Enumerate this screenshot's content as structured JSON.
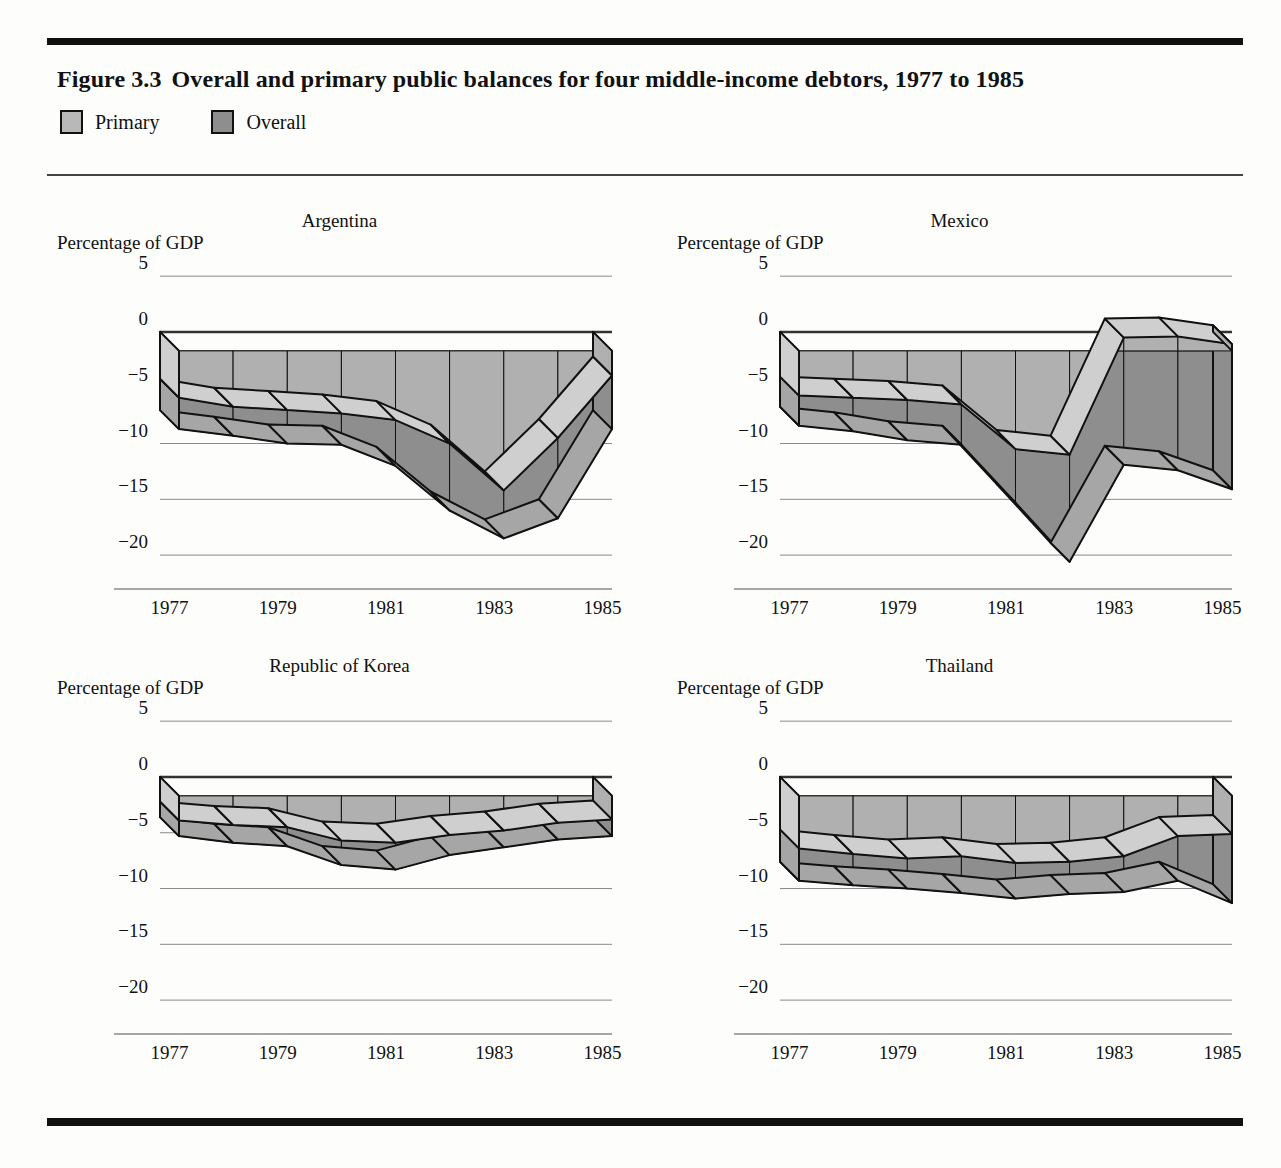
{
  "figure": {
    "number": "Figure 3.3",
    "title": "Overall and primary public balances for four middle-income debtors, 1977 to 1985",
    "unit_label": "Percentage of GDP"
  },
  "legend": {
    "items": [
      {
        "label": "Primary",
        "color": "#b8b8b8"
      },
      {
        "label": "Overall",
        "color": "#8e8e8e"
      }
    ]
  },
  "colors": {
    "primary_top": "#b0b0b0",
    "primary_side": "#cfcfcf",
    "overall_top": "#8e8e8e",
    "overall_side": "#a6a6a6",
    "outline": "#111111",
    "gridline": "#8a8a8a",
    "zeroline": "#333333",
    "rule": "#111111"
  },
  "axis": {
    "yticks": [
      "5",
      "0",
      "-5",
      "-10",
      "-15",
      "-20"
    ],
    "ytick_values": [
      5,
      0,
      -5,
      -10,
      -15,
      -20
    ],
    "ylim": [
      -22.5,
      6
    ],
    "xticks": [
      "1977",
      "1979",
      "1981",
      "1983",
      "1985"
    ],
    "xtick_values": [
      1977,
      1979,
      1981,
      1983,
      1985
    ],
    "years": [
      1977,
      1978,
      1979,
      1980,
      1981,
      1982,
      1983,
      1984,
      1985
    ]
  },
  "chart_data": {
    "type": "area",
    "title": "Overall and primary public balances for four middle-income debtors, 1977 to 1985",
    "xlabel": "",
    "ylabel": "Percentage of GDP",
    "ylim": [
      -22.5,
      6
    ],
    "grid": true,
    "legend_position": "top-left",
    "x": [
      1977,
      1978,
      1979,
      1980,
      1981,
      1982,
      1983,
      1984,
      1985
    ],
    "panels": [
      {
        "name": "Argentina",
        "series": [
          {
            "name": "Primary",
            "values": [
              -4.2,
              -5.0,
              -5.3,
              -5.6,
              -6.2,
              -8.3,
              -12.5,
              -7.8,
              -2.2
            ]
          },
          {
            "name": "Overall",
            "values": [
              -7.0,
              -7.6,
              -8.3,
              -8.4,
              -10.3,
              -14.3,
              -16.8,
              -15.0,
              -7.0
            ]
          }
        ]
      },
      {
        "name": "Mexico",
        "series": [
          {
            "name": "Primary",
            "values": [
              -4.0,
              -4.2,
              -4.4,
              -4.8,
              -8.8,
              -9.3,
              1.2,
              1.3,
              0.6
            ]
          },
          {
            "name": "Overall",
            "values": [
              -6.7,
              -7.2,
              -8.0,
              -8.4,
              -13.6,
              -18.9,
              -10.2,
              -10.7,
              -12.4
            ]
          }
        ]
      },
      {
        "name": "Republic of Korea",
        "series": [
          {
            "name": "Primary",
            "values": [
              -2.2,
              -2.6,
              -2.8,
              -4.0,
              -4.2,
              -3.5,
              -3.1,
              -2.4,
              -2.1
            ]
          },
          {
            "name": "Overall",
            "values": [
              -3.6,
              -4.2,
              -4.5,
              -6.2,
              -6.6,
              -5.3,
              -4.6,
              -3.9,
              -3.6
            ]
          }
        ]
      },
      {
        "name": "Thailand",
        "series": [
          {
            "name": "Primary",
            "values": [
              -4.7,
              -5.2,
              -5.6,
              -5.4,
              -6.0,
              -5.9,
              -5.4,
              -3.6,
              -3.4
            ]
          },
          {
            "name": "Overall",
            "values": [
              -7.6,
              -8.0,
              -8.3,
              -8.7,
              -9.2,
              -8.8,
              -8.6,
              -7.6,
              -9.6
            ]
          }
        ]
      }
    ]
  }
}
